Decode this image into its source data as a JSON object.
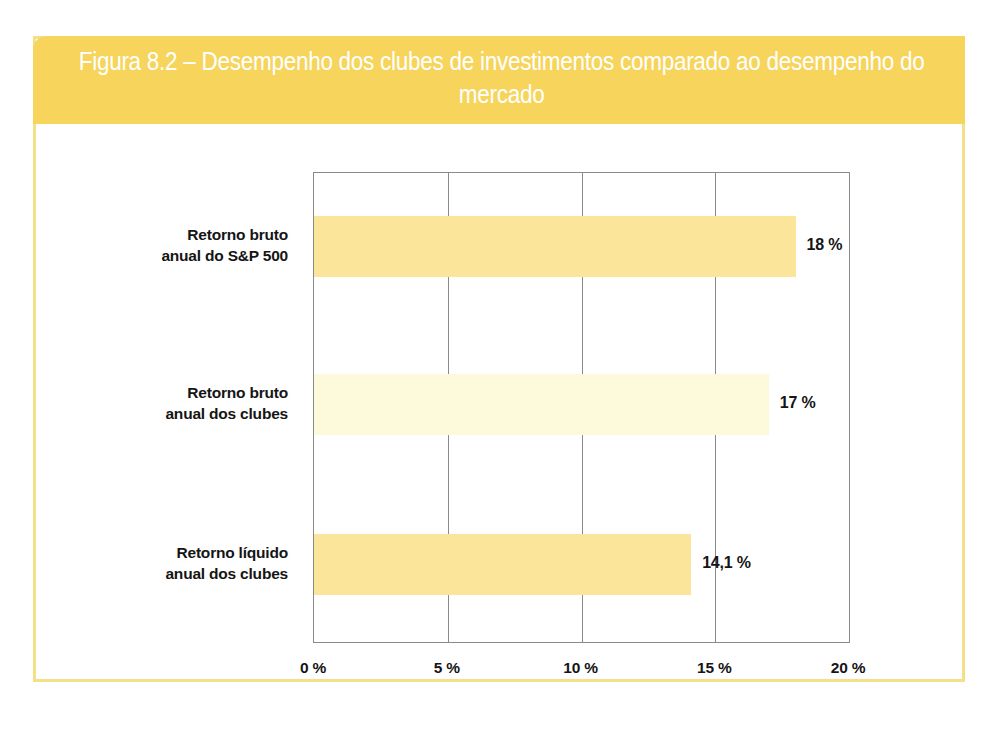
{
  "figure": {
    "title": "Figura 8.2 – Desempenho dos clubes de investimentos comparado ao desempenho do mercado",
    "header_color": "#f7d45c",
    "border_color": "#f5e08a",
    "background_color": "#ffffff"
  },
  "chart_data": {
    "type": "bar",
    "orientation": "horizontal",
    "title": "Figura 8.2 – Desempenho dos clubes de investimentos comparado ao desempenho do mercado",
    "xlabel": "",
    "ylabel": "",
    "xlim": [
      0,
      20
    ],
    "grid": true,
    "legend": "none",
    "categories": [
      "Retorno bruto anual do S&P 500",
      "Retorno bruto anual dos clubes",
      "Retorno líquido anual dos clubes"
    ],
    "category_lines": [
      [
        "Retorno bruto",
        "anual do S&P 500"
      ],
      [
        "Retorno bruto",
        "anual dos clubes"
      ],
      [
        "Retorno líquido",
        "anual dos clubes"
      ]
    ],
    "values": [
      18,
      17,
      14.1
    ],
    "value_labels": [
      "18 %",
      "17 %",
      "14,1 %"
    ],
    "bar_colors": [
      "#fae59a",
      "#fdfadc",
      "#fae59a"
    ],
    "xticks": [
      0,
      5,
      10,
      15,
      20
    ],
    "xtick_labels": [
      "0 %",
      "5 %",
      "10 %",
      "15 %",
      "20 %"
    ],
    "axis_color": "#8a8a8a"
  }
}
